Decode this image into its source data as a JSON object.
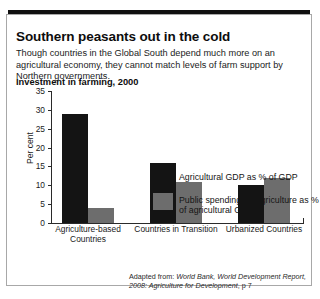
{
  "headline": "Southern peasants out in the cold",
  "standfirst": "Though countries in the Global South depend much more on an agricultural economy, they cannot match levels of farm support by Northern governments.",
  "source_note": {
    "prefix": "Adapted from: ",
    "italic": "World Bank, World Development Report, 2008: Agriculture for Development",
    "suffix": ", p 7"
  },
  "colors": {
    "series_0": "#141414",
    "series_1": "#6d6d6d",
    "frame": "#a8a8a8",
    "rule": "#101010"
  },
  "chart_data": {
    "type": "bar",
    "title": "Investment in farming, 2000",
    "xlabel": "",
    "ylabel": "Per cent",
    "ylim": [
      0,
      35
    ],
    "yticks": [
      0,
      5,
      10,
      15,
      20,
      25,
      30,
      35
    ],
    "grid": false,
    "legend_position": "top-right",
    "categories": [
      "Agriculture-based Countries",
      "Countries in Transition",
      "Urbanized Countries"
    ],
    "series": [
      {
        "name": "Agricultural GDP as % of GDP",
        "values": [
          29,
          16,
          10
        ]
      },
      {
        "name": "Public spending on agriculture as % of agricultural GDP",
        "values": [
          4,
          11,
          12
        ]
      }
    ]
  }
}
